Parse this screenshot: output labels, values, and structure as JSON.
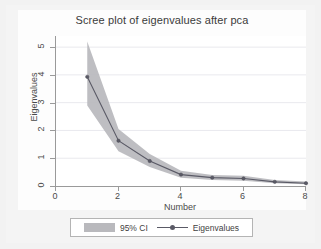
{
  "chart_data": {
    "type": "line",
    "title": "Scree plot of eigenvalues after pca",
    "xlabel": "Number",
    "ylabel": "Eigenvalues",
    "x": [
      1,
      2,
      3,
      4,
      5,
      6,
      7,
      8
    ],
    "xlim": [
      0,
      8
    ],
    "ylim": [
      0,
      5.4
    ],
    "xticks": [
      "0",
      "2",
      "4",
      "6",
      "8"
    ],
    "xtick_values": [
      0,
      2,
      4,
      6,
      8
    ],
    "yticks": [
      "0",
      "1",
      "2",
      "3",
      "4",
      "5"
    ],
    "ytick_values": [
      0,
      1,
      2,
      3,
      4,
      5
    ],
    "grid": "horizontal",
    "legend_position": "bottom-center",
    "series": [
      {
        "name": "Eigenvalues",
        "marker": "circle",
        "color": "#5a5a66",
        "values": [
          3.93,
          1.63,
          0.9,
          0.41,
          0.3,
          0.27,
          0.15,
          0.1
        ]
      },
      {
        "name": "95% CI",
        "type": "band",
        "color": "#b9b9bd",
        "upper": [
          5.2,
          2.05,
          1.15,
          0.55,
          0.4,
          0.37,
          0.22,
          0.16
        ],
        "lower": [
          2.9,
          1.25,
          0.68,
          0.3,
          0.22,
          0.19,
          0.1,
          0.06
        ]
      }
    ]
  },
  "legend": {
    "ci_label": "95% CI",
    "series_label": "Eigenvalues"
  },
  "colors": {
    "band": "#b9b9bd",
    "line": "#5a5a66",
    "grid": "#e9e9ee",
    "axis": "#9a9a9a",
    "plot_background": "#ffffff",
    "page_background": "#f2f2f2"
  }
}
